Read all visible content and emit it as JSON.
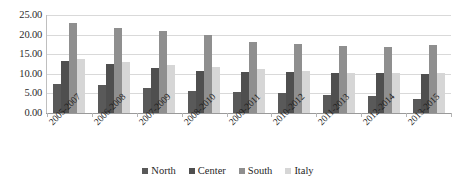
{
  "chart_data": {
    "type": "bar",
    "title": "",
    "subtitle": "",
    "xlabel": "",
    "ylabel": "",
    "ylim": [
      0,
      25
    ],
    "ytick_labels": [
      "25.00",
      "20.00",
      "15.00",
      "10.00",
      "5.00",
      "0.00"
    ],
    "ytick_values": [
      25,
      20,
      15,
      10,
      5,
      0
    ],
    "grid": true,
    "legend_position": "bottom",
    "categories": [
      "2005-2007",
      "2006-2008",
      "2007-2009",
      "2008-2010",
      "2009-2011",
      "2010-2012",
      "2011-2013",
      "2012-2014",
      "2013-2015"
    ],
    "series": [
      {
        "name": "North",
        "color": "#595959",
        "values": [
          7.4,
          7.1,
          6.4,
          5.6,
          5.4,
          5.2,
          4.6,
          4.3,
          3.5
        ]
      },
      {
        "name": "Center",
        "color": "#4f4f4f",
        "values": [
          13.2,
          12.6,
          11.4,
          10.8,
          10.5,
          10.4,
          10.2,
          10.1,
          10.0
        ]
      },
      {
        "name": "South",
        "color": "#8f8f8f",
        "values": [
          22.9,
          21.8,
          21.0,
          19.9,
          18.0,
          17.5,
          17.2,
          16.8,
          17.4
        ]
      },
      {
        "name": "Italy",
        "color": "#d6d6d6",
        "values": [
          13.7,
          13.1,
          12.3,
          11.8,
          11.2,
          10.6,
          10.3,
          10.3,
          10.1
        ]
      }
    ]
  },
  "legend": {
    "items": [
      {
        "label": "North"
      },
      {
        "label": "Center"
      },
      {
        "label": "South"
      },
      {
        "label": "Italy"
      }
    ]
  }
}
